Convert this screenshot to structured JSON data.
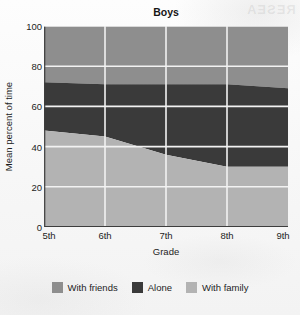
{
  "figure": {
    "title": "Boys",
    "watermark_text": "RESEA"
  },
  "axes": {
    "y_title": "Mean percent of time",
    "x_title": "Grade",
    "y_ticks": [
      0,
      20,
      40,
      60,
      80,
      100
    ],
    "x_ticks": [
      "5th",
      "6th",
      "7th",
      "8th",
      "9th"
    ]
  },
  "legend": {
    "entries": [
      {
        "label": "With friends",
        "color": "#8e8e8e"
      },
      {
        "label": "Alone",
        "color": "#3a3a3a"
      },
      {
        "label": "With family",
        "color": "#b3b3b3"
      }
    ]
  },
  "colors": {
    "with_friends": "#8e8e8e",
    "alone": "#3a3a3a",
    "with_family": "#b3b3b3",
    "gridline": "#f2f2f2",
    "axis": "#3d3d3d",
    "background": "#fbfbfb"
  },
  "chart_data": {
    "type": "area",
    "stacked": true,
    "title": "Boys",
    "xlabel": "Grade",
    "ylabel": "Mean percent of time",
    "categories": [
      "5th",
      "6th",
      "7th",
      "8th",
      "9th"
    ],
    "ylim": [
      0,
      100
    ],
    "yticks": [
      0,
      20,
      40,
      60,
      80,
      100
    ],
    "grid": true,
    "legend_position": "bottom",
    "stack_order_bottom_to_top": [
      "With family",
      "Alone",
      "With friends"
    ],
    "series": [
      {
        "name": "With family",
        "color": "#b3b3b3",
        "values": [
          48,
          45,
          36,
          30,
          30
        ]
      },
      {
        "name": "Alone",
        "color": "#3a3a3a",
        "values": [
          24,
          26,
          35,
          41,
          39
        ]
      },
      {
        "name": "With friends",
        "color": "#8e8e8e",
        "values": [
          28,
          29,
          29,
          29,
          31
        ]
      }
    ],
    "cumulative_boundaries": {
      "with_family_top": [
        48,
        45,
        36,
        30,
        30
      ],
      "alone_top": [
        72,
        71,
        71,
        71,
        69
      ],
      "with_friends_top": [
        100,
        100,
        100,
        100,
        100
      ]
    }
  }
}
